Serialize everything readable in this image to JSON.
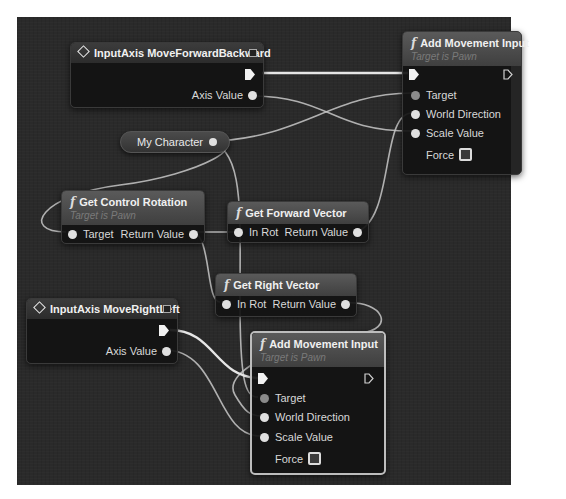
{
  "graph": {
    "type": "Unreal Engine Blueprint Event Graph",
    "nodes": {
      "input_forward": {
        "title": "InputAxis MoveForwardBackward",
        "icon": "event-diamond-icon",
        "pins": {
          "exec_out": "",
          "axis_value": "Axis Value"
        }
      },
      "add_movement_top": {
        "title": "Add Movement Input",
        "subtitle": "Target is Pawn",
        "icon": "function-icon",
        "pins": {
          "target": "Target",
          "world_direction": "World Direction",
          "scale_value": "Scale Value",
          "force": "Force"
        }
      },
      "my_character": {
        "title": "My Character"
      },
      "get_control_rotation": {
        "title": "Get Control Rotation",
        "subtitle": "Target is Pawn",
        "icon": "function-icon",
        "pins": {
          "target": "Target",
          "return_value": "Return Value"
        }
      },
      "get_forward_vector": {
        "title": "Get Forward Vector",
        "icon": "function-icon",
        "pins": {
          "in_rot": "In Rot",
          "return_value": "Return Value"
        }
      },
      "get_right_vector": {
        "title": "Get Right Vector",
        "icon": "function-icon",
        "pins": {
          "in_rot": "In Rot",
          "return_value": "Return Value"
        }
      },
      "input_right": {
        "title": "InputAxis MoveRightLeft",
        "icon": "event-diamond-icon",
        "pins": {
          "exec_out": "",
          "axis_value": "Axis Value"
        }
      },
      "add_movement_bottom": {
        "title": "Add Movement Input",
        "subtitle": "Target is Pawn",
        "icon": "function-icon",
        "selected": true,
        "pins": {
          "target": "Target",
          "world_direction": "World Direction",
          "scale_value": "Scale Value",
          "force": "Force"
        }
      }
    },
    "colors": {
      "canvas": "#2a2a2a",
      "wire": "#c8c8c8",
      "exec_wire": "#e6e6e6",
      "node_body": "#121212",
      "header": "#4a4a4a",
      "selected_border": "#bdbdbd"
    }
  }
}
